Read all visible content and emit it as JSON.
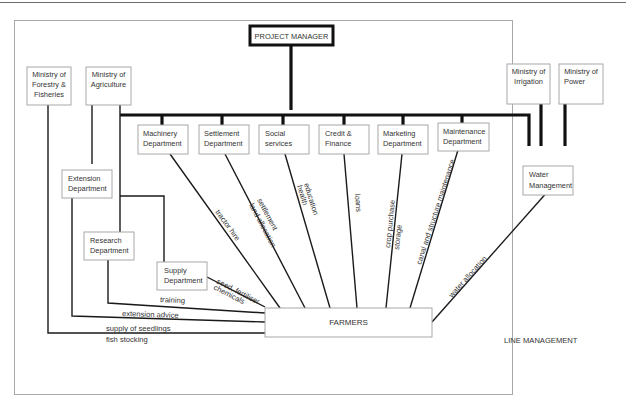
{
  "diagram": {
    "type": "organizational-chart",
    "footer_label": "LINE MANAGEMENT",
    "top": {
      "project_manager": "PROJECT MANAGER"
    },
    "ministries": {
      "forestry": [
        "Ministry of",
        "Forestry &",
        "Fisheries"
      ],
      "agriculture": [
        "Ministry of",
        "Agriculture"
      ],
      "irrigation": [
        "Ministry of",
        "Irrigation"
      ],
      "power": [
        "Ministry of",
        "Power"
      ]
    },
    "departments": [
      {
        "id": "machinery",
        "lines": [
          "Machinery",
          "Department"
        ],
        "flow": [
          "tractor hire"
        ]
      },
      {
        "id": "settlement",
        "lines": [
          "Settlement",
          "Department"
        ],
        "flow": [
          "settlement",
          "land allocation"
        ]
      },
      {
        "id": "social",
        "lines": [
          "Social",
          "services"
        ],
        "flow": [
          "education",
          "health"
        ]
      },
      {
        "id": "credit",
        "lines": [
          "Credit &",
          "Finance"
        ],
        "flow": [
          "loans"
        ]
      },
      {
        "id": "marketing",
        "lines": [
          "Marketing",
          "Department"
        ],
        "flow": [
          "crop purchase",
          "storage"
        ]
      },
      {
        "id": "maintenance",
        "lines": [
          "Maintenance",
          "Department"
        ],
        "flow": [
          "canal and structure maintenance"
        ]
      }
    ],
    "agriculture_units": {
      "extension": {
        "lines": [
          "Extension",
          "Department"
        ],
        "flow": "extension advice"
      },
      "research": {
        "lines": [
          "Research",
          "Department"
        ],
        "flow": "training"
      },
      "supply": {
        "lines": [
          "Supply",
          "Department"
        ],
        "flow": [
          "seed, fertiliser",
          "chemicals"
        ]
      }
    },
    "water_management": {
      "lines": [
        "Water",
        "Management"
      ],
      "flow": "water allocation"
    },
    "forestry_flow": [
      "supply of seedlings",
      "fish stocking"
    ],
    "farmers": "FARMERS"
  }
}
